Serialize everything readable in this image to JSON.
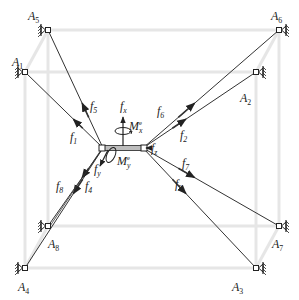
{
  "diagram": {
    "type": "cable-driven parallel robot force diagram",
    "colors": {
      "frame": "#e6e6e6",
      "cable": "#333333",
      "ink": "#222222",
      "background": "#ffffff"
    },
    "frame_corners": {
      "back_top_left": [
        48,
        30
      ],
      "back_top_right": [
        279,
        30
      ],
      "front_top_left": [
        25,
        72
      ],
      "front_top_right": [
        256,
        72
      ],
      "back_bottom_left": [
        48,
        226
      ],
      "back_bottom_right": [
        279,
        226
      ],
      "front_bottom_left": [
        25,
        268
      ],
      "front_bottom_right": [
        256,
        268
      ]
    },
    "anchors": [
      {
        "id": "A1",
        "label": "A",
        "sub": "1",
        "x": 25,
        "y": 72,
        "side": "left",
        "lx": 12,
        "ly": 66
      },
      {
        "id": "A2",
        "label": "A",
        "sub": "2",
        "x": 256,
        "y": 72,
        "side": "right",
        "lx": 240,
        "ly": 102
      },
      {
        "id": "A3",
        "label": "A",
        "sub": "3",
        "x": 256,
        "y": 268,
        "side": "right",
        "lx": 232,
        "ly": 291
      },
      {
        "id": "A4",
        "label": "A",
        "sub": "4",
        "x": 25,
        "y": 268,
        "side": "left",
        "lx": 18,
        "ly": 291
      },
      {
        "id": "A5",
        "label": "A",
        "sub": "5",
        "x": 48,
        "y": 30,
        "side": "left",
        "lx": 28,
        "ly": 20
      },
      {
        "id": "A6",
        "label": "A",
        "sub": "6",
        "x": 279,
        "y": 30,
        "side": "right",
        "lx": 271,
        "ly": 20
      },
      {
        "id": "A7",
        "label": "A",
        "sub": "7",
        "x": 279,
        "y": 226,
        "side": "right",
        "lx": 272,
        "ly": 248
      },
      {
        "id": "A8",
        "label": "A",
        "sub": "8",
        "x": 48,
        "y": 226,
        "side": "left",
        "lx": 48,
        "ly": 248
      }
    ],
    "platform": {
      "left_node": [
        103,
        148
      ],
      "right_node": [
        143,
        148
      ]
    },
    "forces": [
      {
        "id": "f1",
        "label": "f",
        "sub": "1",
        "from": "left_node",
        "to": "A1",
        "lx": 70,
        "ly": 141
      },
      {
        "id": "f2",
        "label": "f",
        "sub": "2",
        "from": "right_node",
        "to": "A2",
        "lx": 180,
        "ly": 139
      },
      {
        "id": "f3",
        "label": "f",
        "sub": "3",
        "from": "right_node",
        "to": "A3",
        "lx": 175,
        "ly": 188
      },
      {
        "id": "f4",
        "label": "f",
        "sub": "4",
        "from": "left_node",
        "to": "A4",
        "lx": 85,
        "ly": 190
      },
      {
        "id": "f5",
        "label": "f",
        "sub": "5",
        "from": "left_node",
        "to": "A5",
        "lx": 90,
        "ly": 110
      },
      {
        "id": "f6",
        "label": "f",
        "sub": "6",
        "from": "right_node",
        "to": "A6",
        "lx": 157,
        "ly": 115
      },
      {
        "id": "f7",
        "label": "f",
        "sub": "7",
        "from": "right_node",
        "to": "A7",
        "lx": 182,
        "ly": 167
      },
      {
        "id": "f8",
        "label": "f",
        "sub": "8",
        "from": "left_node",
        "to": "A8",
        "lx": 56,
        "ly": 190
      }
    ],
    "external_loads": {
      "fx": {
        "label": "f",
        "sub": "x",
        "x": 120,
        "y": 110
      },
      "fz": {
        "label": "f",
        "sub": "z",
        "x": 151,
        "y": 152
      },
      "fy": {
        "label": "f",
        "sub": "y",
        "x": 94,
        "y": 173
      },
      "Mx": {
        "label": "M",
        "sub": "x",
        "sup": "e",
        "x": 129,
        "y": 130
      },
      "My": {
        "label": "M",
        "sub": "y",
        "sup": "e",
        "x": 117,
        "y": 165
      }
    }
  }
}
